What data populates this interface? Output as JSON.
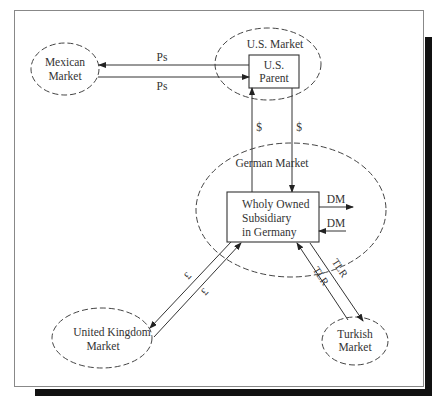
{
  "diagram": {
    "nodes": {
      "mexican_market": {
        "line1": "Mexican",
        "line2": "Market"
      },
      "us_market": {
        "label": "U.S. Market"
      },
      "us_parent": {
        "line1": "U.S.",
        "line2": "Parent"
      },
      "german_market": {
        "label": "German Market"
      },
      "subsidiary": {
        "line1": "Wholy Owned",
        "line2": "Subsidiary",
        "line3": "in Germany"
      },
      "uk_market": {
        "line1": "United Kingdom",
        "line2": "Market"
      },
      "turkish_market": {
        "line1": "Turkish",
        "line2": "Market"
      }
    },
    "flows": {
      "parent_to_mexico": "Ps",
      "mexico_to_parent": "Ps",
      "sub_to_parent": "$",
      "parent_to_sub": "$",
      "sub_to_german_out": "DM",
      "german_to_sub_in": "DM",
      "sub_to_uk": "£",
      "uk_to_sub": "£",
      "sub_to_turkey": "TLR",
      "turkey_to_sub": "TLR"
    }
  }
}
